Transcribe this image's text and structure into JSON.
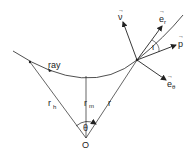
{
  "diagram": {
    "labels": {
      "ray": "ray",
      "r_h": "r",
      "r_h_sub": "h",
      "r_m": "r",
      "r_m_sub": "m",
      "r": "r",
      "theta": "θ",
      "origin": "O",
      "nu": "ν",
      "e_r": "e",
      "e_r_sub": "r",
      "p": "p",
      "e_theta": "e",
      "e_theta_sub": "θ",
      "iota": "ι",
      "vec_arrow": "→"
    },
    "colors": {
      "line": "#222222",
      "background": "#ffffff"
    }
  }
}
